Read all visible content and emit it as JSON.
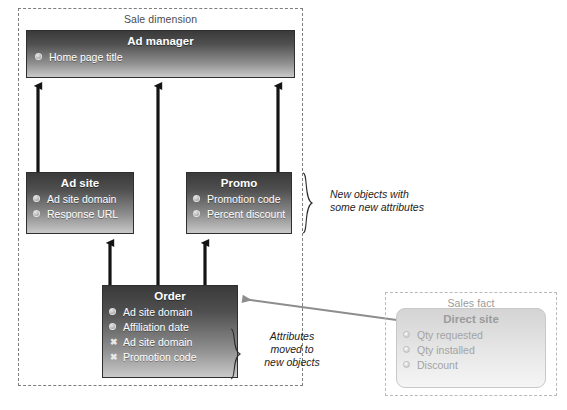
{
  "diagram": {
    "type": "uml-class-refactoring",
    "groups": [
      {
        "id": "sale-dimension",
        "title": "Sale dimension"
      },
      {
        "id": "sales-fact",
        "title": "Sales fact"
      }
    ],
    "entities": [
      {
        "id": "ad-manager",
        "title": "Ad manager",
        "style": "solid",
        "attributes": [
          {
            "label": "Home page title",
            "marker": "circle-icon"
          }
        ]
      },
      {
        "id": "ad-site",
        "title": "Ad site",
        "style": "solid",
        "attributes": [
          {
            "label": "Ad site domain",
            "marker": "circle-icon"
          },
          {
            "label": "Response URL",
            "marker": "circle-icon"
          }
        ]
      },
      {
        "id": "promo",
        "title": "Promo",
        "style": "solid",
        "attributes": [
          {
            "label": "Promotion code",
            "marker": "circle-icon"
          },
          {
            "label": "Percent discount",
            "marker": "circle-icon"
          }
        ]
      },
      {
        "id": "order",
        "title": "Order",
        "style": "solid",
        "attributes": [
          {
            "label": "Ad site domain",
            "marker": "circle-icon"
          },
          {
            "label": "Affiliation date",
            "marker": "circle-icon"
          },
          {
            "label": "Ad site domain",
            "marker": "cross-icon"
          },
          {
            "label": "Promotion code",
            "marker": "cross-icon"
          }
        ]
      },
      {
        "id": "direct-site",
        "title": "Direct site",
        "style": "ghost",
        "attributes": [
          {
            "label": "Qty requested",
            "marker": "circle-icon"
          },
          {
            "label": "Qty installed",
            "marker": "circle-icon"
          },
          {
            "label": "Discount",
            "marker": "circle-icon"
          }
        ]
      }
    ],
    "annotations": [
      {
        "id": "new-objects",
        "line1": "New objects with",
        "line2": "some new attributes"
      },
      {
        "id": "moved-attrs",
        "line1": "Attributes",
        "line2": "moved to",
        "line3": "new objects"
      }
    ],
    "colors": {
      "entity_dark": "#3a3a3a",
      "entity_light": "#c9c9c9",
      "ghost_fill": "#e4e4e4",
      "arrow_black": "#141414",
      "arrow_gray": "#8d8d8d",
      "group_border": "#7d7d7d",
      "text_dark": "#1d1d1d",
      "text_ghost": "#a3a3a3"
    }
  }
}
